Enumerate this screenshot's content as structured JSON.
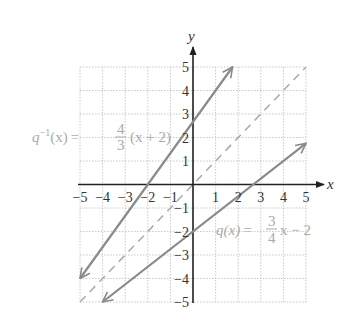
{
  "chart_data": {
    "type": "line",
    "title": "",
    "xlabel": "x",
    "ylabel": "y",
    "xlim": [
      -5,
      5
    ],
    "ylim": [
      -5,
      5
    ],
    "grid": true,
    "x_ticks": [
      "-5",
      "-4",
      "-3",
      "-2",
      "-1",
      "1",
      "2",
      "3",
      "4",
      "5"
    ],
    "y_ticks": [
      "5",
      "4",
      "3",
      "2",
      "1",
      "-1",
      "-2",
      "-3",
      "-4",
      "-5"
    ],
    "series": [
      {
        "name": "q^-1(x) = 4/3 (x + 2)",
        "style": "solid-arrows",
        "points": [
          [
            -5,
            -4
          ],
          [
            1.75,
            5
          ]
        ]
      },
      {
        "name": "q(x) = 3/4 x - 2",
        "style": "solid-arrows",
        "points": [
          [
            -4,
            -5
          ],
          [
            5,
            1.75
          ]
        ]
      },
      {
        "name": "y = x",
        "style": "dashed",
        "points": [
          [
            -5,
            -5
          ],
          [
            5,
            5
          ]
        ]
      }
    ],
    "annotations": [
      {
        "text": "q⁻¹(x) = 4/3 (x + 2)",
        "near": [
          -5,
          2
        ]
      },
      {
        "text": "q(x) = 3/4 x − 2",
        "near": [
          3,
          -2
        ]
      }
    ]
  },
  "labels": {
    "x_axis": "x",
    "y_axis": "y",
    "inverse_fn": {
      "name": "q",
      "sup": "−1",
      "arg": "(x)",
      "eq": "=",
      "num": "4",
      "den": "3",
      "tail": "(x + 2)"
    },
    "fn": {
      "name": "q(x)",
      "eq": "=",
      "num": "3",
      "den": "4",
      "tail": "x − 2"
    }
  },
  "ticks": {
    "x": [
      {
        "label": "−5",
        "v": -5
      },
      {
        "label": "−4",
        "v": -4
      },
      {
        "label": "−3",
        "v": -3
      },
      {
        "label": "−2",
        "v": -2
      },
      {
        "label": "−1",
        "v": -1
      },
      {
        "label": "1",
        "v": 1
      },
      {
        "label": "2",
        "v": 2
      },
      {
        "label": "3",
        "v": 3
      },
      {
        "label": "4",
        "v": 4
      },
      {
        "label": "5",
        "v": 5
      }
    ],
    "y": [
      {
        "label": "5",
        "v": 5
      },
      {
        "label": "4",
        "v": 4
      },
      {
        "label": "3",
        "v": 3
      },
      {
        "label": "2",
        "v": 2
      },
      {
        "label": "1",
        "v": 1
      },
      {
        "label": "−1",
        "v": -1
      },
      {
        "label": "−2",
        "v": -2
      },
      {
        "label": "−3",
        "v": -3
      },
      {
        "label": "−4",
        "v": -4
      },
      {
        "label": "−5",
        "v": -5
      }
    ]
  },
  "colors": {
    "grid": "#bbbbbb",
    "axis": "#222222",
    "line": "#8a8a8a",
    "dashed": "#aaaaaa",
    "label": "#aaaaaa"
  }
}
